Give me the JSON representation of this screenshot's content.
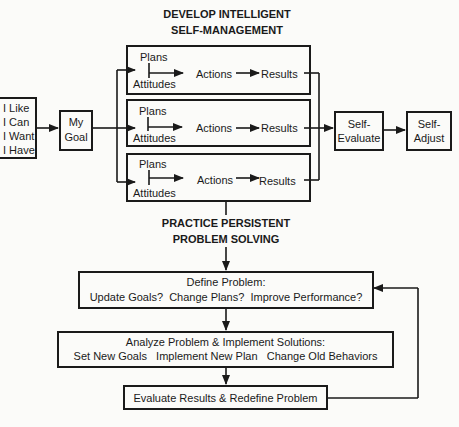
{
  "top_section": {
    "title_line1": "DEVELOP INTELLIGENT",
    "title_line2": "SELF-MANAGEMENT",
    "inputs_box": [
      "I Like",
      "I Can",
      "I Want",
      "I Have"
    ],
    "goal_box": [
      "My",
      "Goal"
    ],
    "branches": [
      {
        "plans": "Plans",
        "attitudes": "Attitudes",
        "actions": "Actions",
        "results": "Results"
      },
      {
        "plans": "Plans",
        "attitudes": "Attitudes",
        "actions": "Actions",
        "results": "Results"
      },
      {
        "plans": "Plans",
        "attitudes": "Attitudes",
        "actions": "Actions",
        "results": "Results"
      }
    ],
    "self_evaluate": [
      "Self-",
      "Evaluate"
    ],
    "self_adjust": [
      "Self-",
      "Adjust"
    ]
  },
  "bottom_section": {
    "title_line1": "PRACTICE PERSISTENT",
    "title_line2": "PROBLEM SOLVING",
    "define_box": {
      "line1": "Define Problem:",
      "line2": "Update Goals?  Change Plans?  Improve Performance?"
    },
    "analyze_box": {
      "line1": "Analyze Problem & Implement Solutions:",
      "line2": "Set New Goals   Implement New Plan   Change Old Behaviors"
    },
    "evaluate_box": {
      "line1": "Evaluate Results & Redefine Problem"
    }
  },
  "colors": {
    "ink": "#1a1a1a",
    "background": "#fbfbf9"
  }
}
